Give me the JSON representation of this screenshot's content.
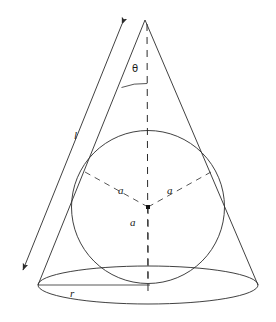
{
  "figure": {
    "background_color": "#ffffff",
    "stroke_color": "#2b2b2b",
    "labels": {
      "slant_height": "l",
      "sphere_radius_upper_left": "a",
      "sphere_radius_upper_right": "a",
      "sphere_radius_down": "a",
      "base_radius": "r",
      "half_apex_angle": "θ"
    },
    "geometry": {
      "apex": [
        145,
        20
      ],
      "base_center": [
        148,
        285
      ],
      "base_ellipse_rx": 110,
      "base_ellipse_ry": 19,
      "base_left": [
        38,
        285
      ],
      "base_right": [
        258,
        285
      ],
      "sphere_center": [
        148,
        207
      ],
      "sphere_radius_px": 76,
      "axis_dashed": true,
      "radii_dashed": true,
      "slant_arrow_double_headed": true,
      "angle_arc_radius_px": 64
    },
    "elements": [
      "apex",
      "left-cone-edge",
      "right-cone-edge",
      "base-ellipse",
      "base-radius-line",
      "axis-dashed-line",
      "inscribed-circle",
      "sphere-center-dot",
      "radius-upper-left-dashed",
      "radius-upper-right-dashed",
      "radius-down-dashed",
      "angle-arc",
      "slant-height-double-arrow"
    ]
  }
}
